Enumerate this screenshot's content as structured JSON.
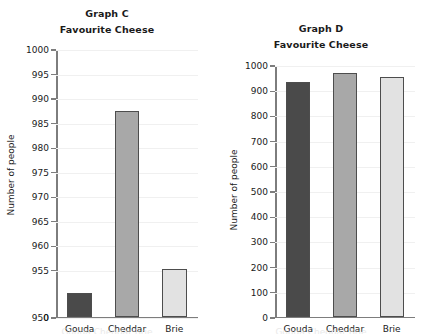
{
  "chart_data": [
    {
      "type": "bar",
      "id": "graph-c",
      "title": "Graph C",
      "subtitle": "Favourite Cheese",
      "xlabel": "",
      "ylabel": "Number of people",
      "categories": [
        "Gouda",
        "Cheddar",
        "Brie"
      ],
      "values": [
        950.5,
        987.5,
        955.3
      ],
      "ytick_labels": [
        "1000",
        "995",
        "990",
        "985",
        "980",
        "975",
        "970",
        "965",
        "960",
        "955",
        "950",
        "0"
      ],
      "ytick_values": [
        1000,
        995,
        990,
        985,
        980,
        975,
        970,
        965,
        960,
        955,
        950,
        0
      ],
      "ylim": [
        950,
        1000
      ],
      "axis_break": true,
      "grid": true,
      "legend": "none",
      "bar_colors": [
        "#4a4a4a",
        "#a8a8a8",
        "#e2e2e2"
      ]
    },
    {
      "type": "bar",
      "id": "graph-d",
      "title": "Graph D",
      "subtitle": "Favourite Cheese",
      "xlabel": "",
      "ylabel": "Number of people",
      "categories": [
        "Gouda",
        "Cheddar",
        "Brie"
      ],
      "values": [
        938,
        972,
        955
      ],
      "ytick_labels": [
        "1000",
        "900",
        "800",
        "700",
        "600",
        "500",
        "400",
        "300",
        "200",
        "100",
        "0"
      ],
      "ytick_values": [
        1000,
        900,
        800,
        700,
        600,
        500,
        400,
        300,
        200,
        100,
        0
      ],
      "ylim": [
        0,
        1000
      ],
      "axis_break": false,
      "grid": true,
      "legend": "none",
      "bar_colors": [
        "#4a4a4a",
        "#a8a8a8",
        "#e2e2e2"
      ]
    }
  ],
  "figure": {
    "background": "#ffffff",
    "axis_color": "#7d7d7d",
    "bar_border_color": "#4d4d4d",
    "grid_color": "#f0f0f0",
    "bottom_clipped_text": "Gouda Cheddar Brie"
  }
}
